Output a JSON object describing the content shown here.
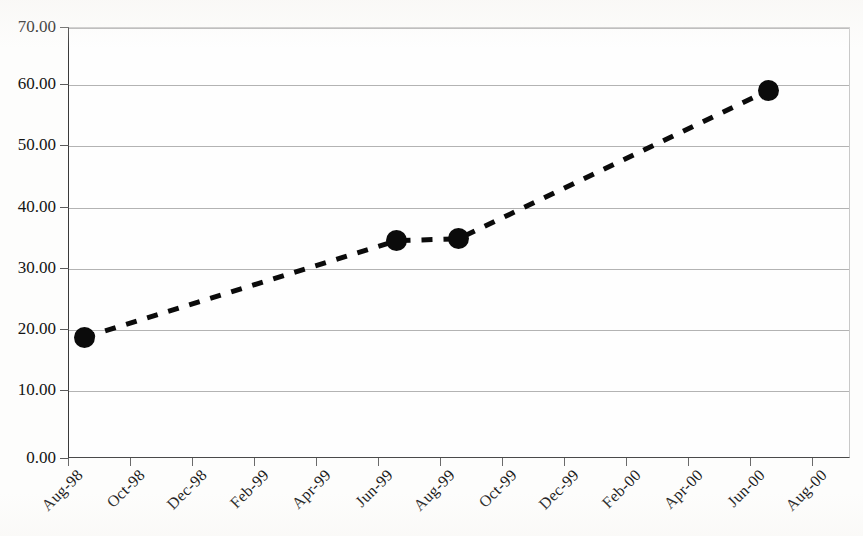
{
  "chart_data": {
    "type": "line",
    "title": "",
    "subtitle": "",
    "xlabel": "",
    "ylabel": "",
    "ylim": [
      0,
      70
    ],
    "y_ticks": [
      "0.00",
      "10.00",
      "20.00",
      "30.00",
      "40.00",
      "50.00",
      "60.00",
      "70.00"
    ],
    "y_tick_values": [
      0,
      10,
      20,
      30,
      40,
      50,
      60,
      70
    ],
    "x_ticks": [
      "Aug-98",
      "Oct-98",
      "Dec-98",
      "Feb-99",
      "Apr-99",
      "Jun-99",
      "Aug-99",
      "Oct-99",
      "Dec-99",
      "Feb-00",
      "Apr-00",
      "Jun-00",
      "Aug-00"
    ],
    "grid": "horizontal",
    "legend": "none",
    "series": [
      {
        "name": "series-1",
        "line_style": "dashed",
        "line_color": "#0b0b0b",
        "line_width": 5,
        "marker": "circle",
        "marker_color": "#0b0b0b",
        "marker_size": 21,
        "points": [
          {
            "x_label": "Sep-98",
            "x_value": 0.26,
            "y": 19.6
          },
          {
            "x_label": "Jun-99",
            "x_value": 5.3,
            "y": 35.3
          },
          {
            "x_label": "Aug-99",
            "x_value": 6.3,
            "y": 35.6
          },
          {
            "x_label": "Jun-00",
            "x_value": 11.3,
            "y": 59.7
          }
        ]
      }
    ]
  },
  "axes": {
    "y_axis_name": "value-axis",
    "x_axis_name": "date-axis"
  },
  "colors": {
    "background": "#fdfdfc",
    "plot_background": "#fefefe",
    "gridline": "#b3b3b3",
    "axis": "#3a3a3a",
    "data": "#0b0b0b",
    "text": "#141414"
  }
}
